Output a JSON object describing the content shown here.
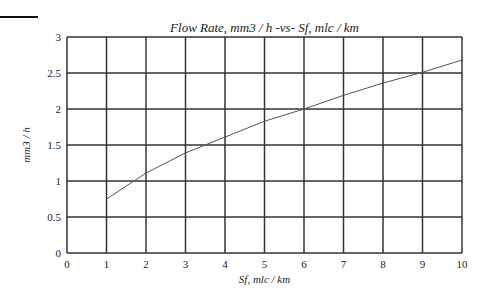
{
  "chart_data": {
    "type": "line",
    "title": "Flow Rate, mm3 / h -vs- Sf, mlc / km",
    "xlabel": "Sf, mlc / km",
    "ylabel": "mm3 / h",
    "xlim": [
      0,
      10
    ],
    "ylim": [
      0,
      3
    ],
    "grid": true,
    "x_ticks": [
      "0",
      "1",
      "2",
      "3",
      "4",
      "5",
      "6",
      "7",
      "8",
      "9",
      "10"
    ],
    "y_ticks": [
      "0",
      "0.5",
      "1",
      "1.5",
      "2",
      "2.5",
      "3"
    ],
    "series": [
      {
        "name": "Flow Rate",
        "x": [
          1,
          2,
          3,
          4,
          5,
          6,
          7,
          8,
          9,
          10
        ],
        "values": [
          0.75,
          1.11,
          1.39,
          1.61,
          1.83,
          2.0,
          2.19,
          2.36,
          2.51,
          2.68
        ],
        "color": "#555555"
      }
    ]
  }
}
